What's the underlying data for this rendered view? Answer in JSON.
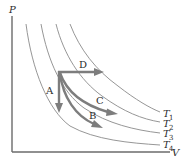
{
  "diagram": {
    "axes": {
      "y_label": "P",
      "x_label": "V"
    },
    "isotherms": [
      {
        "id": "T1",
        "label": "T",
        "subscript": "1"
      },
      {
        "id": "T2",
        "label": "T",
        "subscript": "2"
      },
      {
        "id": "T3",
        "label": "T",
        "subscript": "3"
      },
      {
        "id": "T4",
        "label": "T",
        "subscript": "4"
      }
    ],
    "processes": [
      {
        "id": "A",
        "label": "A",
        "description": "isovolumetric (constant volume) pressure drop"
      },
      {
        "id": "B",
        "label": "B",
        "description": "adiabatic expansion"
      },
      {
        "id": "C",
        "label": "C",
        "description": "isothermal expansion"
      },
      {
        "id": "D",
        "label": "D",
        "description": "isobaric (constant pressure) expansion"
      }
    ],
    "colors": {
      "axis": "#6b6b6b",
      "isotherm": "#8a8a8a",
      "process": "#7d7d7d",
      "text": "#2b2b2b"
    }
  }
}
